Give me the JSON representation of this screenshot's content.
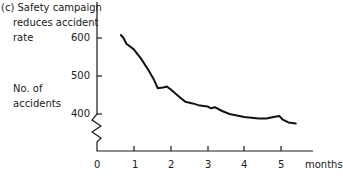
{
  "chart_data": {
    "type": "line",
    "title_lines": [
      "(c) Safety campaign",
      "reduces accident",
      "rate"
    ],
    "xlabel": "months",
    "ylabel": "No. of accidents",
    "ylabel_lines": [
      "No. of",
      "accidents"
    ],
    "x_ticks": [
      "0",
      "1",
      "2",
      "3",
      "4",
      "5"
    ],
    "y_ticks": [
      "400",
      "500",
      "600"
    ],
    "xlim": [
      0,
      5.8
    ],
    "ylim": [
      400,
      620
    ],
    "y_axis_break": true,
    "grid": false,
    "series": [
      {
        "name": "Accidents",
        "x": [
          0.65,
          0.72,
          0.8,
          1.0,
          1.2,
          1.4,
          1.55,
          1.65,
          1.8,
          1.9,
          2.0,
          2.2,
          2.4,
          2.6,
          2.8,
          3.0,
          3.1,
          3.2,
          3.4,
          3.6,
          3.8,
          4.0,
          4.2,
          4.4,
          4.6,
          4.8,
          4.95,
          5.05,
          5.2,
          5.4
        ],
        "values": [
          608,
          600,
          585,
          570,
          545,
          515,
          490,
          468,
          470,
          472,
          465,
          448,
          432,
          428,
          422,
          420,
          415,
          418,
          408,
          400,
          396,
          392,
          390,
          388,
          388,
          392,
          395,
          385,
          378,
          375
        ]
      }
    ]
  }
}
